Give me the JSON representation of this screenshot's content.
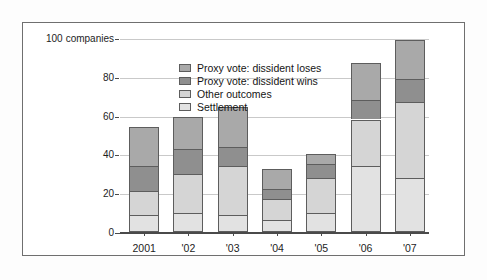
{
  "chart_data": {
    "type": "bar",
    "stacked": true,
    "title": "",
    "subtitle": "",
    "xlabel": "",
    "ylabel": "",
    "axis_unit_label": "companies",
    "categories": [
      "2001",
      "'02",
      "'03",
      "'04",
      "'05",
      "'06",
      "'07"
    ],
    "ylim": [
      0,
      100
    ],
    "yticks": [
      0,
      20,
      40,
      60,
      80,
      100
    ],
    "ytick_labels": [
      "0",
      "20",
      "40",
      "60",
      "80",
      "100"
    ],
    "grid": true,
    "legend_position": "inside-top-center",
    "series": [
      {
        "name": "Settlement",
        "color": "#e2e2e2",
        "values": [
          9,
          10,
          9,
          6,
          10,
          34,
          28
        ]
      },
      {
        "name": "Other outcomes",
        "color": "#d5d5d5",
        "values": [
          12,
          20,
          25,
          11,
          18,
          24,
          39
        ]
      },
      {
        "name": "Proxy vote: dissident wins",
        "color": "#8f8f8f",
        "values": [
          13,
          13,
          10,
          5,
          7,
          10,
          12
        ]
      },
      {
        "name": "Proxy vote: dissident loses",
        "color": "#a9a9a9",
        "values": [
          20,
          16.5,
          20.5,
          10.5,
          5,
          19,
          20
        ]
      }
    ],
    "stack_order_bottom_to_top": [
      "Settlement",
      "Other outcomes",
      "Proxy vote: dissident wins",
      "Proxy vote: dissident loses"
    ],
    "totals": [
      54,
      59.5,
      64.5,
      32.5,
      40,
      87,
      99
    ]
  },
  "legend": {
    "items": [
      {
        "label": "Proxy vote: dissident loses",
        "color": "#a9a9a9"
      },
      {
        "label": "Proxy vote: dissident wins",
        "color": "#8f8f8f"
      },
      {
        "label": "Other outcomes",
        "color": "#d5d5d5"
      },
      {
        "label": "Settlement",
        "color": "#e2e2e2"
      }
    ]
  },
  "colors": {
    "frame_border": "#6f6f6f",
    "axis": "#4a4a4a",
    "gridline": "#c9c9c9",
    "bar_outline": "#5d5d5d",
    "background": "#ffffff",
    "text": "#1d1d1d"
  }
}
